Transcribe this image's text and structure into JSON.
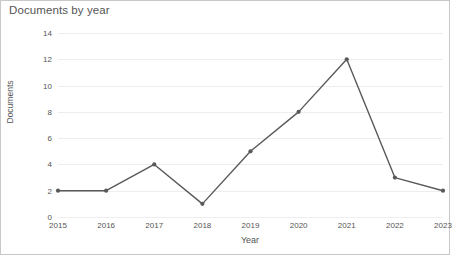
{
  "chart_data": {
    "type": "line",
    "title": "Documents by year",
    "xlabel": "Year",
    "ylabel": "Documents",
    "categories": [
      "2015",
      "2016",
      "2017",
      "2018",
      "2019",
      "2020",
      "2021",
      "2022",
      "2023"
    ],
    "values": [
      2,
      2,
      4,
      1,
      5,
      8,
      12,
      3,
      2
    ],
    "series": [
      {
        "name": "Documents",
        "values": [
          2,
          2,
          4,
          1,
          5,
          8,
          12,
          3,
          2
        ]
      }
    ],
    "ylim": [
      0,
      14
    ],
    "yticks": [
      "0",
      "2",
      "4",
      "6",
      "8",
      "10",
      "12",
      "14"
    ],
    "ytick_values": [
      0,
      2,
      4,
      6,
      8,
      10,
      12,
      14
    ],
    "grid": "horizontal",
    "legend": "none",
    "line_color": "#595959",
    "marker": "circle",
    "marker_color": "#595959",
    "gridline_color": "#eeeeee",
    "background_color": "#ffffff",
    "text_color": "#555555"
  }
}
